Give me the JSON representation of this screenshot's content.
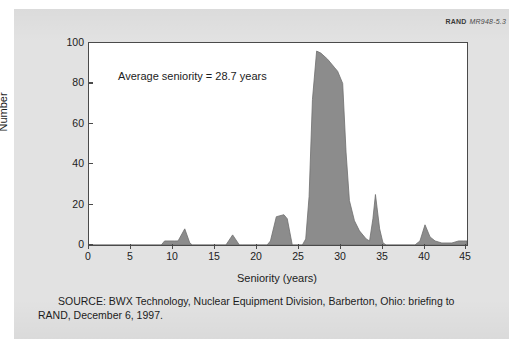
{
  "figure": {
    "org_label": "RAND",
    "figure_number": "MR948-5.3",
    "annotation": "Average seniority = 28.7 years",
    "source_note": "SOURCE:  BWX Technology, Nuclear Equipment Division, Barberton, Ohio:  briefing to RAND, December 6, 1997.",
    "fill_color": "#8c8c8c",
    "line_color": "#4a4a4a",
    "page_background": "#e2e2e2",
    "plot_background": "#ffffff"
  },
  "chart_data": {
    "type": "area",
    "title": "",
    "subtitle": "",
    "xlabel": "Seniority (years)",
    "ylabel": "Number",
    "xlim": [
      0,
      45
    ],
    "ylim": [
      0,
      100
    ],
    "xticks": [
      0,
      5,
      10,
      15,
      20,
      25,
      30,
      35,
      40,
      45
    ],
    "yticks": [
      0,
      20,
      40,
      60,
      80,
      100
    ],
    "grid": false,
    "legend": null,
    "annotations": [
      {
        "text": "Average seniority = 28.7 years",
        "x": 4.5,
        "y": 84
      }
    ],
    "series": [
      {
        "name": "Employees by seniority",
        "x": [
          0,
          1,
          2,
          3,
          4,
          5,
          6,
          7,
          8,
          9,
          10,
          11,
          12,
          13,
          14,
          15,
          16,
          17,
          18,
          19,
          20,
          21,
          22,
          23,
          24,
          25,
          26,
          27,
          28,
          29,
          30,
          31,
          32,
          33,
          34,
          35,
          36,
          37,
          38,
          39,
          40,
          41,
          42,
          43,
          44,
          45
        ],
        "values": [
          0,
          0,
          0,
          0,
          0,
          0,
          0,
          0,
          0,
          2,
          2,
          8,
          0,
          0,
          0,
          0,
          0,
          5,
          0,
          0,
          0,
          1,
          14,
          15,
          0,
          0,
          40,
          96,
          93,
          88,
          80,
          22,
          7,
          2,
          25,
          1,
          0,
          0,
          0,
          1,
          10,
          2,
          1,
          1,
          2,
          2
        ]
      }
    ],
    "detail_points": {
      "comment": "Higher-resolution outline vertices read off the plotted curve (x in years, y in number).",
      "x": [
        0,
        8.6,
        9.0,
        9.4,
        10.2,
        10.6,
        11.4,
        12.0,
        12.3,
        16.3,
        17.1,
        17.9,
        18.3,
        21.2,
        21.6,
        22.3,
        23.2,
        23.6,
        24.2,
        25.4,
        25.8,
        26.2,
        26.6,
        27.1,
        27.6,
        28.4,
        29.2,
        29.6,
        30.2,
        30.6,
        31.0,
        31.6,
        32.2,
        33.0,
        33.4,
        33.8,
        34.1,
        34.6,
        35.0,
        35.4,
        38.8,
        39.4,
        40.0,
        40.6,
        41.2,
        42.0,
        43.2,
        44.0,
        44.6,
        45.0
      ],
      "y": [
        0,
        0,
        2,
        2,
        2,
        2,
        8,
        1,
        0,
        0,
        5,
        0,
        0,
        0,
        2,
        14,
        15,
        13,
        0,
        0,
        3,
        24,
        72,
        96,
        95,
        92,
        88,
        86,
        80,
        46,
        22,
        12,
        7,
        3,
        2,
        13,
        25,
        8,
        1,
        0,
        0,
        2,
        10,
        4,
        2,
        1,
        1,
        2,
        2,
        2
      ]
    },
    "summary_statistic": {
      "label": "Average seniority",
      "value": 28.7,
      "unit": "years"
    }
  }
}
